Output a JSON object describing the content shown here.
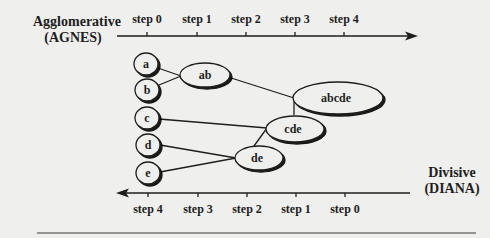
{
  "diagram": {
    "agglomerative": {
      "label": "Agglomerative",
      "abbr": "(AGNES)",
      "steps": [
        "step 0",
        "step 1",
        "step 2",
        "step 3",
        "step 4"
      ]
    },
    "divisive": {
      "label": "Divisive",
      "abbr": "(DIANA)",
      "steps": [
        "step 4",
        "step 3",
        "step 2",
        "step 1",
        "step 0"
      ]
    },
    "nodes": {
      "a": "a",
      "b": "b",
      "c": "c",
      "d": "d",
      "e": "e",
      "ab": "ab",
      "de": "de",
      "cde": "cde",
      "abcde": "abcde"
    },
    "colors": {
      "background": "#efefed",
      "ink": "#1e1e1e"
    }
  }
}
